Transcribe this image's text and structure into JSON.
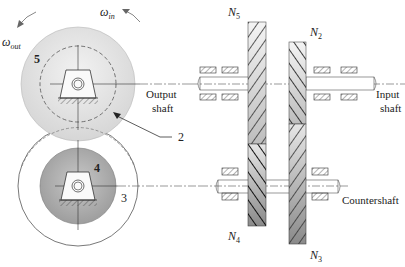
{
  "diagram": {
    "type": "compound gear train (reverted)",
    "labels": {
      "omega_out": "ω",
      "omega_out_sub": "out",
      "omega_in": "ω",
      "omega_in_sub": "in",
      "gear5": "5",
      "gear4": "4",
      "gear3": "3",
      "gear2": "2",
      "output_shaft_line1": "Output",
      "output_shaft_line2": "shaft",
      "input_shaft_line1": "Input",
      "input_shaft_line2": "shaft",
      "countershaft": "Countershaft",
      "N5": "N",
      "N5_sub": "5",
      "N2": "N",
      "N2_sub": "2",
      "N4": "N",
      "N4_sub": "4",
      "N3": "N",
      "N3_sub": "3"
    },
    "colors": {
      "gear5_fill": "#e0e0e0",
      "gear4_fill": "#a9a9a9",
      "line": "#333333",
      "hatch": "#222222"
    }
  }
}
